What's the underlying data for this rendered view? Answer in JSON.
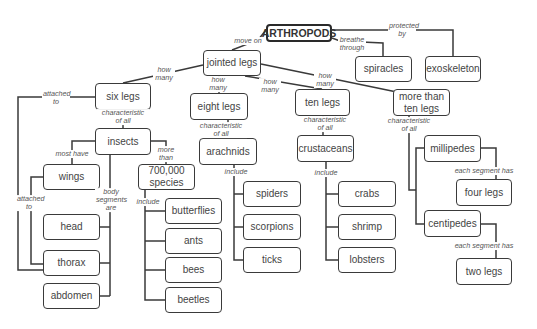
{
  "diagram": {
    "title": "ARTHROPODS",
    "nodes": {
      "arthropods": "ARTHROPODS",
      "jointed_legs": "jointed legs",
      "spiracles": "spiracles",
      "exoskeleton": "exoskeleton",
      "six_legs": "six legs",
      "eight_legs": "eight legs",
      "ten_legs": "ten legs",
      "more_than_ten_legs": "more than ten legs",
      "insects": "insects",
      "arachnids": "arachnids",
      "crustaceans": "crustaceans",
      "wings": "wings",
      "species_700000": "700,000 species",
      "millipedes": "millipedes",
      "four_legs": "four legs",
      "spiders": "spiders",
      "crabs": "crabs",
      "butterflies": "butterflies",
      "head": "head",
      "scorpions": "scorpions",
      "shrimp": "shrimp",
      "centipedes": "centipedes",
      "ants": "ants",
      "thorax": "thorax",
      "ticks": "ticks",
      "lobsters": "lobsters",
      "two_legs": "two legs",
      "bees": "bees",
      "abdomen": "abdomen",
      "beetles": "beetles"
    },
    "links": {
      "move_on": "move on",
      "protected_by": "protected by",
      "breathe_through": "breathe through",
      "how_many_six": "how many",
      "how_many_eight": "how many",
      "how_many_ten": "how many",
      "how_many_more": "how many",
      "attached_to_six": "attached to",
      "char_insects": "characteristic of all",
      "char_arachnids": "characteristic of all",
      "char_crustaceans": "characteristic of all",
      "char_myriapods": "characteristic of all",
      "most_have": "most have",
      "more_than": "more than",
      "body_segments_are": "body segments are",
      "attached_to_wings": "attached to",
      "include_species": "include",
      "include_arachnids": "include",
      "include_crustaceans": "include",
      "each_segment_millipedes": "each segment has",
      "each_segment_centipedes": "each segment has"
    },
    "colors": {
      "line": "#3a3a3a",
      "text": "#444444",
      "label": "#555555",
      "background": "#ffffff"
    }
  }
}
